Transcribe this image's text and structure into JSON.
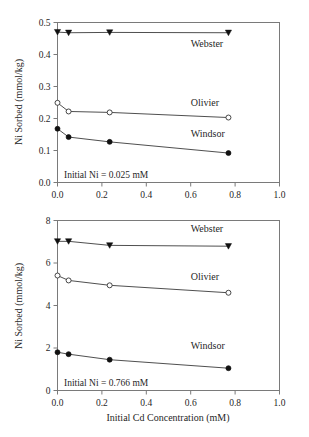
{
  "figure": {
    "name": "ni-sorption-vs-cd-concentration",
    "panel_count": 2
  },
  "chart_data": [
    {
      "id": "top",
      "type": "line",
      "title": "",
      "xlabel": "",
      "ylabel": "Ni Sorbed (mmol/kg)",
      "xlim": [
        0.0,
        1.0
      ],
      "ylim": [
        0.0,
        0.5
      ],
      "xticks": [
        "0.0",
        "0.2",
        "0.4",
        "0.6",
        "0.8",
        "1.0"
      ],
      "xtick_values": [
        0.0,
        0.2,
        0.4,
        0.6,
        0.8,
        1.0
      ],
      "yticks": [
        "0.0",
        "0.1",
        "0.2",
        "0.3",
        "0.4",
        "0.5"
      ],
      "ytick_values": [
        0.0,
        0.1,
        0.2,
        0.3,
        0.4,
        0.5
      ],
      "grid": false,
      "legend_position": "inline-right-of-series",
      "annotation": "Initial Ni = 0.025 mM",
      "x": [
        0.0,
        0.05,
        0.235,
        0.77
      ],
      "series": [
        {
          "name": "Webster",
          "marker": "triangle-down-filled",
          "values": [
            0.47,
            0.468,
            0.469,
            0.468
          ],
          "label_x": 0.6,
          "label_y": 0.425
        },
        {
          "name": "Olivier",
          "marker": "circle-open",
          "values": [
            0.249,
            0.222,
            0.219,
            0.203
          ],
          "label_x": 0.6,
          "label_y": 0.238
        },
        {
          "name": "Windsor",
          "marker": "circle-filled",
          "values": [
            0.168,
            0.142,
            0.127,
            0.092
          ],
          "label_x": 0.6,
          "label_y": 0.142
        }
      ]
    },
    {
      "id": "bottom",
      "type": "line",
      "title": "",
      "xlabel": "Initial Cd Concentration (mM)",
      "ylabel": "Ni Sorbed (mmol/kg)",
      "xlim": [
        0.0,
        1.0
      ],
      "ylim": [
        0,
        8
      ],
      "xticks": [
        "0.0",
        "0.2",
        "0.4",
        "0.6",
        "0.8",
        "1.0"
      ],
      "xtick_values": [
        0.0,
        0.2,
        0.4,
        0.6,
        0.8,
        1.0
      ],
      "yticks": [
        "0",
        "2",
        "4",
        "6",
        "8"
      ],
      "ytick_values": [
        0,
        2,
        4,
        6,
        8
      ],
      "grid": false,
      "legend_position": "inline-right-of-series",
      "annotation": "Initial Ni = 0.766 mM",
      "x": [
        0.0,
        0.05,
        0.235,
        0.77
      ],
      "series": [
        {
          "name": "Webster",
          "marker": "triangle-down-filled",
          "values": [
            7.02,
            7.02,
            6.83,
            6.79
          ],
          "label_x": 0.6,
          "label_y": 7.45
        },
        {
          "name": "Olivier",
          "marker": "circle-open",
          "values": [
            5.41,
            5.18,
            4.95,
            4.6
          ],
          "label_x": 0.6,
          "label_y": 5.2
        },
        {
          "name": "Windsor",
          "marker": "circle-filled",
          "values": [
            1.8,
            1.71,
            1.45,
            1.05
          ],
          "label_x": 0.6,
          "label_y": 1.95
        }
      ]
    }
  ],
  "colors": {
    "frame": "#7a7a7a",
    "line": "#3b3b3b",
    "marker_fill": "#111111",
    "marker_open_fill": "#ffffff",
    "text": "#1f1f1f",
    "background": "#ffffff"
  }
}
